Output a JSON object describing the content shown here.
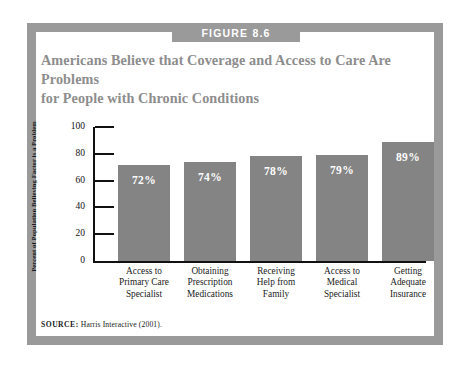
{
  "figure": {
    "badge_label": "FIGURE 8.6",
    "title_line1": "Americans Believe that Coverage and Access to Care Are Problems",
    "title_line2": "for People with Chronic Conditions",
    "source_label": "SOURCE:",
    "source_text": "Harris Interactive (2001).",
    "frame_color": "#9a9a9a",
    "badge_color": "#9a9a9a",
    "title_color": "#8d8d8d",
    "bar_color": "#848484"
  },
  "chart_data": {
    "type": "bar",
    "title": "Americans Believe that Coverage and Access to Care Are Problems for People with Chronic Conditions",
    "xlabel": "",
    "ylabel": "Percent of Population Believing Factor is a Problem",
    "ylim": [
      0,
      100
    ],
    "yticks": [
      0,
      20,
      40,
      60,
      80,
      100
    ],
    "ytick_labels": [
      "0",
      "20",
      "40",
      "60",
      "80",
      "100"
    ],
    "grid": false,
    "legend": false,
    "categories": [
      "Access to Primary Care Specialist",
      "Obtaining Prescription Medications",
      "Receiving Help from Family",
      "Access to Medical Specialist",
      "Getting Adequate Insurance"
    ],
    "category_lines": [
      [
        "Access to",
        "Primary Care",
        "Specialist"
      ],
      [
        "Obtaining",
        "Prescription",
        "Medications"
      ],
      [
        "Receiving",
        "Help from",
        "Family"
      ],
      [
        "Access to",
        "Medical",
        "Specialist"
      ],
      [
        "Getting",
        "Adequate",
        "Insurance"
      ]
    ],
    "values": [
      72,
      74,
      78,
      79,
      89
    ],
    "value_labels": [
      "72%",
      "74%",
      "78%",
      "79%",
      "89%"
    ]
  }
}
